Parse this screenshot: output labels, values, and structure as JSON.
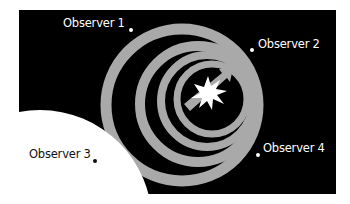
{
  "diagram": {
    "colors": {
      "background": "#ffffff",
      "space": "#000000",
      "wavefront": "#a9a9a9",
      "planet": "#ffffff",
      "source_star": "#ffffff",
      "velocity_arrow": "#a9a9a9",
      "label_on_dark": "#ffffff",
      "label_on_light": "#111111"
    },
    "source": {
      "icon": "star-burst-icon",
      "center": [
        208,
        93
      ],
      "direction_arrow": "arrow-up-right-icon"
    },
    "wavefronts": [
      {
        "cx": 182,
        "cy": 105,
        "r": 76,
        "width": 11
      },
      {
        "cx": 198,
        "cy": 104,
        "r": 58,
        "width": 10
      },
      {
        "cx": 207,
        "cy": 101,
        "r": 46,
        "width": 8
      },
      {
        "cx": 212,
        "cy": 99,
        "r": 35,
        "width": 7
      }
    ],
    "observers": [
      {
        "label": "Observer 1",
        "dot": [
          131,
          30
        ],
        "label_pos": [
          63,
          17
        ],
        "tone": "light"
      },
      {
        "label": "Observer 2",
        "dot": [
          252,
          50
        ],
        "label_pos": [
          258,
          38
        ],
        "tone": "light"
      },
      {
        "label": "Observer 3",
        "dot": [
          95,
          161
        ],
        "label_pos": [
          29,
          148
        ],
        "tone": "dark"
      },
      {
        "label": "Observer 4",
        "dot": [
          258,
          155
        ],
        "label_pos": [
          263,
          142
        ],
        "tone": "light"
      }
    ]
  }
}
